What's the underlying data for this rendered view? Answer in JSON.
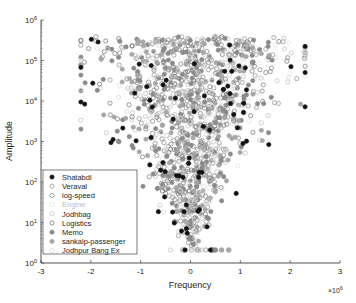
{
  "chart_data": {
    "type": "scatter",
    "title": "",
    "xlabel": "Frequency",
    "ylabel": "Amplitude",
    "x_exponent_label": "× 10^6",
    "xlim": [
      -3,
      3
    ],
    "ylim_log10": [
      0,
      6
    ],
    "yscale": "log",
    "x_ticks": [
      "-3",
      "-2",
      "-1",
      "0",
      "1",
      "2",
      "3"
    ],
    "y_ticks": [
      "10^0",
      "10^1",
      "10^2",
      "10^3",
      "10^4",
      "10^5",
      "10^6"
    ],
    "grid": false,
    "legend_position": "lower left",
    "series": [
      {
        "name": "Shatabdi",
        "marker": "filled-circle",
        "color": "#111111"
      },
      {
        "name": "Veraval",
        "marker": "open-circle",
        "color": "#8c8c8c"
      },
      {
        "name": "log-speed",
        "marker": "open-circle",
        "color": "#7a7a7a"
      },
      {
        "name": "Engine",
        "marker": "open-circle",
        "color": "#e0e0e0"
      },
      {
        "name": "Jodhbag",
        "marker": "open-circle",
        "color": "#bdbdbd"
      },
      {
        "name": "Logistics",
        "marker": "open-circle",
        "color": "#6e6e6e"
      },
      {
        "name": "Memo",
        "marker": "filled-circle",
        "color": "#8a8a8a"
      },
      {
        "name": "sankalp-passenger",
        "marker": "filled-circle",
        "color": "#a6a6a6"
      },
      {
        "name": "Jodhpur Bang Ex",
        "marker": "open-circle",
        "color": "#d9d9d9"
      }
    ]
  },
  "legend": {
    "items": [
      "Shatabdi",
      "Veraval",
      "log-speed",
      "Engine",
      "Jodhbag",
      "Logistics",
      "Memo",
      "sankalp-passenger",
      "Jodhpur Bang Ex"
    ]
  },
  "axes": {
    "xlabel": "Frequency",
    "ylabel": "Amplitude",
    "x_multiplier": "×10",
    "x_multiplier_exp": "6",
    "x_ticks": [
      "-3",
      "-2",
      "-1",
      "0",
      "1",
      "2",
      "3"
    ],
    "y_tick_exps": [
      "0",
      "1",
      "2",
      "3",
      "4",
      "5",
      "6"
    ]
  }
}
